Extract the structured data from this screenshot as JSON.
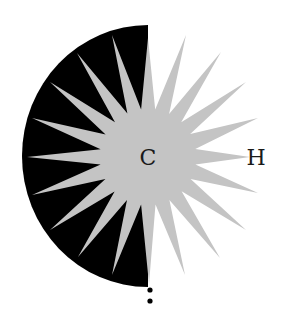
{
  "figure": {
    "colors": {
      "disk": "#000000",
      "star": "#c4c4c4",
      "label": "#1a1a1a",
      "background": "#ffffff"
    },
    "center": [
      148,
      157
    ],
    "disk": {
      "cx": 148,
      "cy": 156,
      "rx": 126,
      "ry": 131,
      "side": "left"
    },
    "star": {
      "points_count": 20,
      "inner_radius": 48,
      "tips": [
        [
          148,
          38
        ],
        [
          186,
          35
        ],
        [
          221,
          52
        ],
        [
          246,
          82
        ],
        [
          258,
          118
        ],
        [
          250,
          157
        ],
        [
          258,
          193
        ],
        [
          246,
          230
        ],
        [
          220,
          258
        ],
        [
          185,
          275
        ],
        [
          149,
          284
        ],
        [
          112,
          275
        ],
        [
          78,
          257
        ],
        [
          50,
          230
        ],
        [
          32,
          195
        ],
        [
          27,
          157
        ],
        [
          32,
          118
        ],
        [
          50,
          82
        ],
        [
          77,
          53
        ],
        [
          112,
          35
        ]
      ]
    },
    "labels": {
      "center_atom": "C",
      "right_atom": "H"
    },
    "dots": [
      [
        150,
        290
      ],
      [
        150,
        301
      ]
    ]
  }
}
